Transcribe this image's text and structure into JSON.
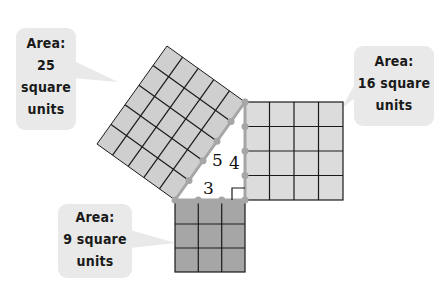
{
  "diagram": {
    "type": "pythagorean-theorem-squares",
    "triangle": {
      "sides": {
        "hypotenuse": "5",
        "vertical_leg": "4",
        "horizontal_leg": "3"
      },
      "right_angle_marker": true
    },
    "squares": [
      {
        "id": "hypotenuse-square",
        "grid": 5,
        "area": 25,
        "fill": "#cfcfcf"
      },
      {
        "id": "vertical-leg-square",
        "grid": 4,
        "area": 16,
        "fill": "#dcdcdc"
      },
      {
        "id": "horizontal-leg-square",
        "grid": 3,
        "area": 9,
        "fill": "#a6a6a6"
      }
    ],
    "colors": {
      "grid_line": "#1a1a1a",
      "vertex_dot": "#a6a6a6",
      "callout_bg": "#e9e9e9"
    }
  },
  "callouts": {
    "area25": {
      "line1": "Area:",
      "line2": "25",
      "line3": "square",
      "line4": "units"
    },
    "area16": {
      "line1": "Area:",
      "line2": "16 square",
      "line3": "units"
    },
    "area9": {
      "line1": "Area:",
      "line2": "9 square",
      "line3": "units"
    }
  }
}
